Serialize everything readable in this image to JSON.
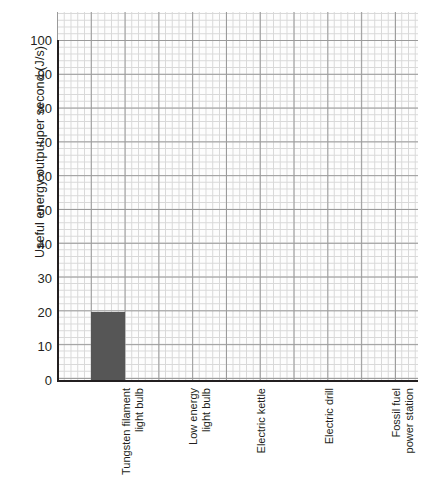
{
  "chart_data": {
    "type": "bar",
    "title": "",
    "xlabel": "",
    "ylabel": "Useful energy output per second (J/s)",
    "categories": [
      "Tungsten filament\nlight bulb",
      "Low energy\nlight bulb",
      "Electric kettle",
      "Electric drill",
      "Fossil fuel\npower station"
    ],
    "values": [
      20,
      null,
      null,
      null,
      null
    ],
    "ylim": [
      0,
      100
    ],
    "yticks": [
      0,
      10,
      20,
      30,
      40,
      50,
      60,
      70,
      80,
      90,
      100
    ],
    "ytick_labels": [
      "0",
      "10",
      "20",
      "30",
      "40",
      "50",
      "60",
      "70",
      "80",
      "90",
      "100"
    ],
    "grid": true,
    "grid_style": "graph-paper-minor-and-major",
    "legend": "none",
    "bar_color": "#565656",
    "axis_color": "#231f20",
    "grid_major_color": "#9a9a9a",
    "grid_minor_color": "#d8d8d8"
  },
  "axes": {
    "y_title": "Useful energy output per second (J/s)"
  }
}
